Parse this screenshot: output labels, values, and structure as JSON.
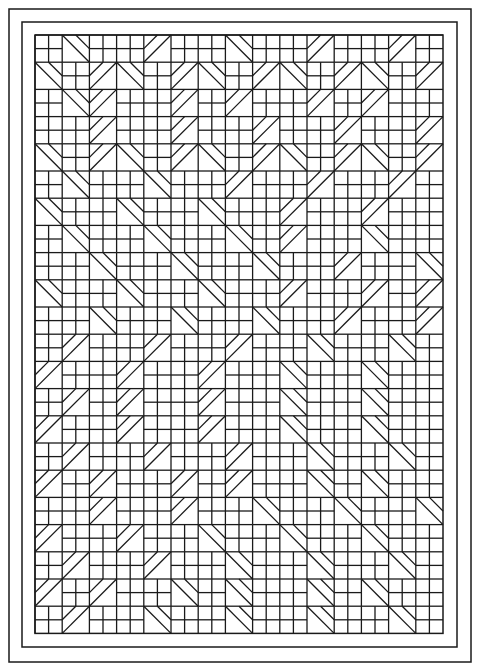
{
  "artwork": {
    "title": "Geometric quilt pattern line drawing",
    "stroke_color": "#1a1a1a",
    "background": "#ffffff",
    "borders": [
      {
        "x": 9,
        "y": 9,
        "w": 462,
        "h": 653
      },
      {
        "x": 22,
        "y": 22,
        "w": 435,
        "h": 625
      }
    ],
    "grid": {
      "x": 35,
      "y": 35,
      "cols": 15,
      "rows": 22,
      "cell": 27.2
    },
    "legend": "S = 2x2 squares, D = down-right diagonal strip, U = up-right diagonal strip, X = plain square",
    "cells": [
      "SDSSUSSDSSUSSUS",
      "DSUDSUDSUDSUDSU",
      "SDUSSUSUSSUSUSS",
      "SSUSSUSSUSSUSSU",
      "DSUDSUDSUDSUDSU",
      "SDSSDSSUSSUSSUS",
      "DSSDSSDSSUSSUSS",
      "SDSSDSSDSUSSDSS",
      "SSDSSDSSDSSUSSD",
      "DSSDSSDSSUSSUSU",
      "SSDSSDSSDSSUSSU",
      "SUSSUSSUSSDSSDS",
      "USSUSSUSSDSSDSS",
      "SUSUSSUSSDSSDSS",
      "USSUSSUSSDSSDSS",
      "SUSSUSSUSSDSSDS",
      "USUSSUSUSSDSDSS",
      "SSUSSUSSDSSDSSD",
      "USSUSSDSSDSSDSS",
      "SUSSUSSDSSDSSDS",
      "USUSSDSDSSDSDSS",
      "SUSSDSSDSSDSSDS"
    ]
  }
}
